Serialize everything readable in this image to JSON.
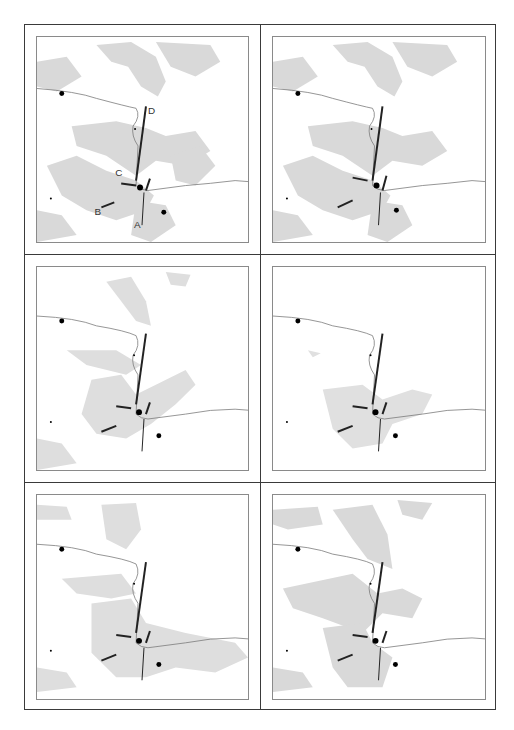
{
  "figure": {
    "layout": "3 rows x 2 columns of map panels",
    "panels": [
      {
        "id": 1,
        "row": 1,
        "col": 1,
        "vegetation_density": "high",
        "labels": [
          "A",
          "B",
          "C",
          "D"
        ]
      },
      {
        "id": 2,
        "row": 1,
        "col": 2,
        "vegetation_density": "high",
        "labels": []
      },
      {
        "id": 3,
        "row": 2,
        "col": 1,
        "vegetation_density": "medium",
        "labels": []
      },
      {
        "id": 4,
        "row": 2,
        "col": 2,
        "vegetation_density": "low",
        "labels": []
      },
      {
        "id": 5,
        "row": 3,
        "col": 1,
        "vegetation_density": "medium",
        "labels": []
      },
      {
        "id": 6,
        "row": 3,
        "col": 2,
        "vegetation_density": "high",
        "labels": []
      }
    ],
    "labels": {
      "A": "A",
      "B": "B",
      "C": "C",
      "D": "D"
    },
    "colors": {
      "frame": "#3a3a3a",
      "map_border": "#8a8a8a",
      "vegetation": "#d9d9d9",
      "river": "#7a7a7a",
      "road": "#222222",
      "settlement": "#000000"
    },
    "legend_symbols": [
      "settlement-dot",
      "river-line",
      "road-segment",
      "shaded-vegetation-area"
    ]
  }
}
